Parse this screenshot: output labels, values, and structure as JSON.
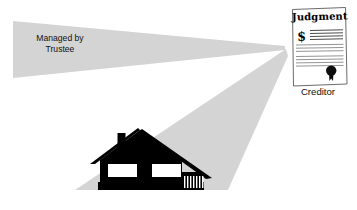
{
  "diagram": {
    "background_color": "#ffffff",
    "beam_color": "#d4d4d4",
    "silhouette_color": "#000000"
  },
  "trustee": {
    "line1": "Managed by",
    "line2": "Trustee"
  },
  "creditor": {
    "label": "Creditor"
  },
  "document": {
    "title": "Judgment",
    "currency_symbol": "$",
    "seal_name": "wax-seal",
    "rule_count": 11
  },
  "house": {
    "name": "house-silhouette",
    "window_count": 2,
    "has_chimney": true,
    "has_porch_railing": true
  },
  "beams": [
    {
      "name": "trustee-beam",
      "direction": "left"
    },
    {
      "name": "property-beam",
      "direction": "down-left"
    }
  ]
}
